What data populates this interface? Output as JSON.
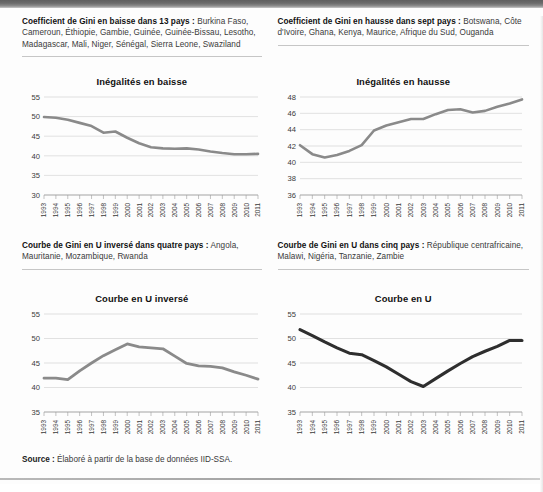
{
  "panels": [
    {
      "id": "baisse",
      "caption_bold": "Coefficient de Gini en baisse dans 13 pays :",
      "caption_body": " Burkina Faso, Cameroun, Éthiopie, Gambie, Guinée, Guinée-Bissau, Lesotho, Madagascar, Mali, Niger, Sénégal, Sierra Leone, Swaziland"
    },
    {
      "id": "hausse",
      "caption_bold": "Coefficient de Gini en hausse dans sept pays :",
      "caption_body": " Botswana, Côte d'Ivoire, Ghana, Kenya, Maurice, Afrique du Sud, Ouganda"
    },
    {
      "id": "u-inverse",
      "caption_bold": "Courbe de Gini en U inversé dans quatre pays :",
      "caption_body": " Angola, Mauritanie, Mozambique, Rwanda"
    },
    {
      "id": "u",
      "caption_bold": "Courbe de Gini en U dans cinq pays :",
      "caption_body": " République centrafricaine, Malawi, Nigéria, Tanzanie, Zambie"
    }
  ],
  "source": {
    "label": "Source :",
    "text": " Élaboré à partir de la base de données IID-SSA."
  },
  "colors": {
    "line_gray": "#8a8a8a",
    "line_dark": "#3a3a3a",
    "grid": "#cfcfcf",
    "axis": "#9a9a9a",
    "text": "#1c1c1c"
  },
  "chart_data": [
    {
      "type": "line",
      "title": "Inégalités en baisse",
      "xlabel": "",
      "ylabel": "",
      "grid": true,
      "legend": "none",
      "line_color": "#8a8a8a",
      "line_width": 2.6,
      "ylim": [
        30,
        55
      ],
      "yticks": [
        30,
        35,
        40,
        45,
        50,
        55
      ],
      "x": [
        "1993",
        "1994",
        "1995",
        "1996",
        "1997",
        "1998",
        "1999",
        "2000",
        "2001",
        "2002",
        "2003",
        "2004",
        "2005",
        "2006",
        "2007",
        "2008",
        "2009",
        "2010",
        "2011"
      ],
      "values": [
        49.9,
        49.7,
        49.2,
        48.4,
        47.6,
        45.9,
        46.2,
        44.6,
        43.2,
        42.2,
        41.9,
        41.8,
        41.9,
        41.6,
        41.1,
        40.7,
        40.4,
        40.4,
        40.5
      ]
    },
    {
      "type": "line",
      "title": "Inégalités en hausse",
      "xlabel": "",
      "ylabel": "",
      "grid": true,
      "legend": "none",
      "line_color": "#8a8a8a",
      "line_width": 2.6,
      "ylim": [
        36,
        48
      ],
      "yticks": [
        36,
        38,
        40,
        42,
        44,
        46,
        48
      ],
      "x": [
        "1993",
        "1994",
        "1995",
        "1996",
        "1997",
        "1998",
        "1999",
        "2000",
        "2001",
        "2002",
        "2003",
        "2004",
        "2005",
        "2006",
        "2007",
        "2008",
        "2009",
        "2010",
        "2011"
      ],
      "values": [
        42.1,
        41.0,
        40.6,
        40.9,
        41.4,
        42.1,
        43.9,
        44.5,
        44.9,
        45.3,
        45.3,
        45.9,
        46.4,
        46.5,
        46.1,
        46.3,
        46.8,
        47.2,
        47.7
      ]
    },
    {
      "type": "line",
      "title": "Courbe en U inversé",
      "xlabel": "",
      "ylabel": "",
      "grid": true,
      "legend": "none",
      "line_color": "#8a8a8a",
      "line_width": 2.8,
      "ylim": [
        35,
        55
      ],
      "yticks": [
        35,
        40,
        45,
        50,
        55
      ],
      "x": [
        "1993",
        "1994",
        "1995",
        "1996",
        "1997",
        "1998",
        "1999",
        "2000",
        "2001",
        "2002",
        "2003",
        "2004",
        "2005",
        "2006",
        "2007",
        "2008",
        "2009",
        "2010",
        "2011"
      ],
      "values": [
        41.9,
        41.9,
        41.6,
        43.4,
        45.0,
        46.5,
        47.7,
        48.9,
        48.3,
        48.1,
        47.9,
        46.4,
        44.9,
        44.4,
        44.3,
        44.0,
        43.2,
        42.5,
        41.7
      ]
    },
    {
      "type": "line",
      "title": "Courbe en U",
      "xlabel": "",
      "ylabel": "",
      "grid": true,
      "legend": "none",
      "line_color": "#2e2e2e",
      "line_width": 3.1,
      "ylim": [
        35,
        55
      ],
      "yticks": [
        35,
        40,
        45,
        50,
        55
      ],
      "x": [
        "1993",
        "1994",
        "1995",
        "1996",
        "1997",
        "1998",
        "1999",
        "2000",
        "2001",
        "2002",
        "2003",
        "2004",
        "2005",
        "2006",
        "2007",
        "2008",
        "2009",
        "2010",
        "2011"
      ],
      "values": [
        51.8,
        50.6,
        49.3,
        48.1,
        47.0,
        46.7,
        45.5,
        44.2,
        42.7,
        41.2,
        40.2,
        41.8,
        43.4,
        44.9,
        46.3,
        47.4,
        48.4,
        49.6,
        49.6
      ]
    }
  ]
}
